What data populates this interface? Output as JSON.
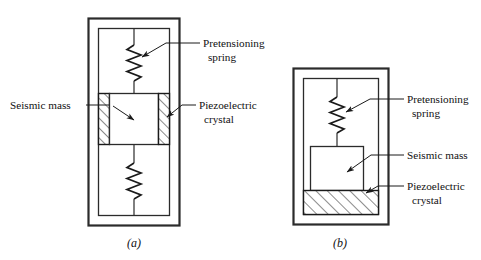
{
  "figure": {
    "background_color": "#ffffff",
    "line_color": "#2b2b2b",
    "text_color": "#111111",
    "width": 481,
    "height": 260
  },
  "diagram_a": {
    "caption": "(a)",
    "labels": {
      "spring_line1": "Pretensioning",
      "spring_line2": "spring",
      "mass": "Seismic mass",
      "crystal_line1": "Piezoelectric",
      "crystal_line2": "crystal"
    },
    "parts": {
      "housing": "outer-housing",
      "inner_frame": "inner-frame",
      "spring_top": "pretensioning-spring-top",
      "spring_bottom": "pretensioning-spring-bottom",
      "seismic_mass": "seismic-mass-block",
      "crystal_left": "piezoelectric-crystal-left",
      "crystal_right": "piezoelectric-crystal-right"
    }
  },
  "diagram_b": {
    "caption": "(b)",
    "labels": {
      "spring_line1": "Pretensioning",
      "spring_line2": "spring",
      "mass": "Seismic mass",
      "crystal_line1": "Piezoelectric",
      "crystal_line2": "crystal"
    },
    "parts": {
      "housing": "outer-housing",
      "inner_frame": "inner-frame",
      "spring_top": "pretensioning-spring",
      "seismic_mass": "seismic-mass-block",
      "crystal_bottom": "piezoelectric-crystal-bottom"
    }
  }
}
